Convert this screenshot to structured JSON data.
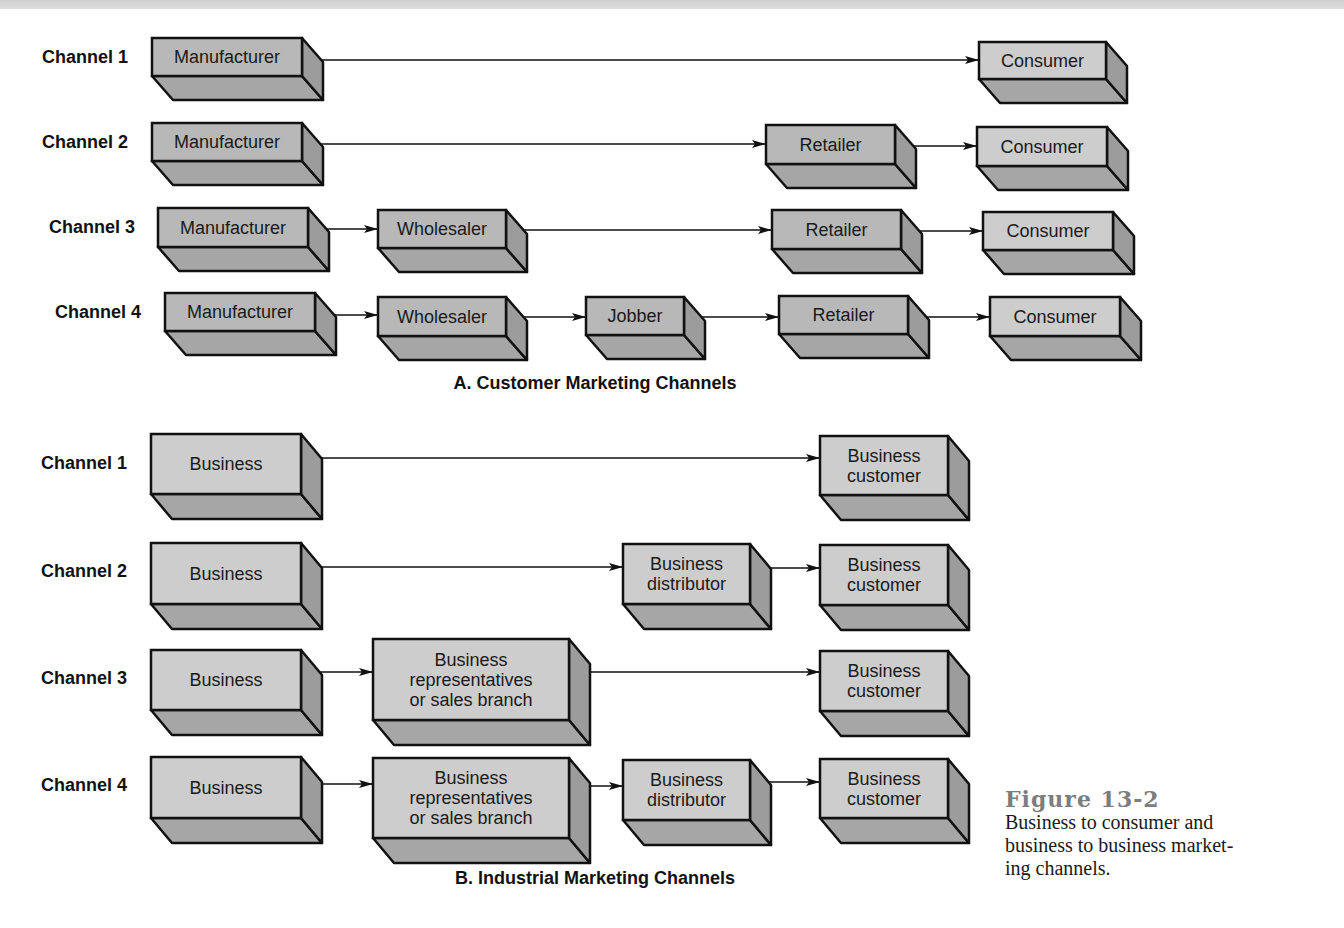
{
  "colors": {
    "box_front": "#b8b8b8",
    "box_front_light": "#cdcdcd",
    "box_side": "#9c9c9c",
    "box_bottom": "#a6a6a6",
    "outline": "#111111",
    "caption_title": "#7d7d7d"
  },
  "depth": {
    "a": {
      "dx": 21,
      "dy": 24
    },
    "b": {
      "dx": 21,
      "dy": 25
    }
  },
  "sections": [
    {
      "id": "a",
      "title": "A. Customer Marketing Channels",
      "title_pos": {
        "x": 595,
        "y": 373
      },
      "channels": [
        {
          "label": "Channel 1",
          "label_pos": {
            "x": 42,
            "y": 57
          },
          "nodes": [
            {
              "text": [
                "Manufacturer"
              ],
              "x": 152,
              "y": 38,
              "w": 150,
              "h": 38,
              "tone": "dark"
            },
            {
              "text": [
                "Consumer"
              ],
              "x": 979,
              "y": 42,
              "w": 127,
              "h": 37,
              "tone": "light"
            }
          ]
        },
        {
          "label": "Channel 2",
          "label_pos": {
            "x": 42,
            "y": 142
          },
          "nodes": [
            {
              "text": [
                "Manufacturer"
              ],
              "x": 152,
              "y": 123,
              "w": 150,
              "h": 38,
              "tone": "dark"
            },
            {
              "text": [
                "Retailer"
              ],
              "x": 766,
              "y": 125,
              "w": 129,
              "h": 39,
              "tone": "dark"
            },
            {
              "text": [
                "Consumer"
              ],
              "x": 977,
              "y": 127,
              "w": 130,
              "h": 39,
              "tone": "light"
            }
          ]
        },
        {
          "label": "Channel 3",
          "label_pos": {
            "x": 49,
            "y": 227
          },
          "nodes": [
            {
              "text": [
                "Manufacturer"
              ],
              "x": 158,
              "y": 208,
              "w": 150,
              "h": 39,
              "tone": "dark"
            },
            {
              "text": [
                "Wholesaler"
              ],
              "x": 378,
              "y": 210,
              "w": 128,
              "h": 38,
              "tone": "dark"
            },
            {
              "text": [
                "Retailer"
              ],
              "x": 772,
              "y": 210,
              "w": 129,
              "h": 39,
              "tone": "dark"
            },
            {
              "text": [
                "Consumer"
              ],
              "x": 983,
              "y": 212,
              "w": 130,
              "h": 38,
              "tone": "light"
            }
          ]
        },
        {
          "label": "Channel 4",
          "label_pos": {
            "x": 55,
            "y": 312
          },
          "nodes": [
            {
              "text": [
                "Manufacturer"
              ],
              "x": 165,
              "y": 293,
              "w": 150,
              "h": 38,
              "tone": "dark"
            },
            {
              "text": [
                "Wholesaler"
              ],
              "x": 378,
              "y": 297,
              "w": 128,
              "h": 39,
              "tone": "dark"
            },
            {
              "text": [
                "Jobber"
              ],
              "x": 586,
              "y": 297,
              "w": 98,
              "h": 38,
              "tone": "dark"
            },
            {
              "text": [
                "Retailer"
              ],
              "x": 779,
              "y": 296,
              "w": 129,
              "h": 38,
              "tone": "dark"
            },
            {
              "text": [
                "Consumer"
              ],
              "x": 990,
              "y": 297,
              "w": 130,
              "h": 39,
              "tone": "light"
            }
          ]
        }
      ]
    },
    {
      "id": "b",
      "title": "B. Industrial Marketing Channels",
      "title_pos": {
        "x": 595,
        "y": 868
      },
      "channels": [
        {
          "label": "Channel 1",
          "label_pos": {
            "x": 41,
            "y": 463
          },
          "nodes": [
            {
              "text": [
                "Business"
              ],
              "x": 151,
              "y": 434,
              "w": 150,
              "h": 60,
              "tone": "light"
            },
            {
              "text": [
                "Business",
                "customer"
              ],
              "x": 820,
              "y": 436,
              "w": 128,
              "h": 59,
              "tone": "light"
            }
          ]
        },
        {
          "label": "Channel 2",
          "label_pos": {
            "x": 41,
            "y": 571
          },
          "nodes": [
            {
              "text": [
                "Business"
              ],
              "x": 151,
              "y": 543,
              "w": 150,
              "h": 61,
              "tone": "light"
            },
            {
              "text": [
                "Business",
                "distributor"
              ],
              "x": 623,
              "y": 544,
              "w": 127,
              "h": 60,
              "tone": "light"
            },
            {
              "text": [
                "Business",
                "customer"
              ],
              "x": 820,
              "y": 545,
              "w": 128,
              "h": 60,
              "tone": "light"
            }
          ]
        },
        {
          "label": "Channel 3",
          "label_pos": {
            "x": 41,
            "y": 678
          },
          "nodes": [
            {
              "text": [
                "Business"
              ],
              "x": 151,
              "y": 650,
              "w": 150,
              "h": 60,
              "tone": "light"
            },
            {
              "text": [
                "Business",
                "representatives",
                "or sales branch"
              ],
              "x": 373,
              "y": 639,
              "w": 196,
              "h": 81,
              "tone": "light"
            },
            {
              "text": [
                "Business",
                "customer"
              ],
              "x": 820,
              "y": 651,
              "w": 128,
              "h": 60,
              "tone": "light"
            }
          ]
        },
        {
          "label": "Channel 4",
          "label_pos": {
            "x": 41,
            "y": 785
          },
          "nodes": [
            {
              "text": [
                "Business"
              ],
              "x": 151,
              "y": 757,
              "w": 150,
              "h": 61,
              "tone": "light"
            },
            {
              "text": [
                "Business",
                "representatives",
                "or sales branch"
              ],
              "x": 373,
              "y": 758,
              "w": 196,
              "h": 80,
              "tone": "light"
            },
            {
              "text": [
                "Business",
                "distributor"
              ],
              "x": 623,
              "y": 760,
              "w": 127,
              "h": 60,
              "tone": "light"
            },
            {
              "text": [
                "Business",
                "customer"
              ],
              "x": 820,
              "y": 759,
              "w": 128,
              "h": 59,
              "tone": "light"
            }
          ]
        }
      ]
    }
  ],
  "caption": {
    "figure": "Figure 13-2",
    "description": [
      "Business to consumer and",
      "business to business market-",
      "ing channels."
    ]
  }
}
